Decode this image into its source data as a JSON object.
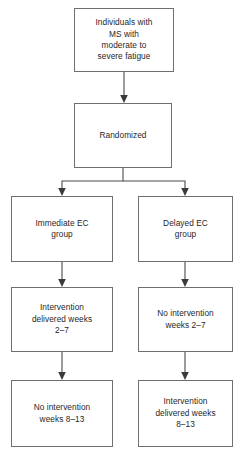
{
  "diagram": {
    "type": "flowchart",
    "orientation": "top-down",
    "colors": {
      "box_border": "#6f6f6f",
      "box_fill": "#ffffff",
      "arrow": "#4a4a4a",
      "text": "#1f1f1f",
      "background": "#ffffff"
    },
    "nodes": {
      "population": {
        "label": "Individuals with\nMS with\nmoderate to\nsevere fatigue",
        "row": 1
      },
      "randomized": {
        "label": "Randomized",
        "row": 2
      },
      "immediate_arm": {
        "label": "Immediate EC\ngroup",
        "row": 3,
        "column": "left"
      },
      "delayed_arm": {
        "label": "Delayed EC\ngroup",
        "row": 3,
        "column": "right"
      },
      "immediate_phase1": {
        "label": "Intervention\ndelivered weeks\n2–7",
        "row": 4,
        "column": "left"
      },
      "delayed_phase1": {
        "label": "No intervention\nweeks 2–7",
        "row": 4,
        "column": "right"
      },
      "immediate_phase2": {
        "label": "No intervention\nweeks 8–13",
        "row": 5,
        "column": "left"
      },
      "delayed_phase2": {
        "label": "Intervention\ndelivered weeks\n8–13",
        "row": 5,
        "column": "right"
      }
    },
    "edges": [
      {
        "from": "population",
        "to": "randomized",
        "style": "arrow"
      },
      {
        "from": "randomized",
        "to": "immediate_arm",
        "style": "split-arrow"
      },
      {
        "from": "randomized",
        "to": "delayed_arm",
        "style": "split-arrow"
      },
      {
        "from": "immediate_arm",
        "to": "immediate_phase1",
        "style": "arrow"
      },
      {
        "from": "delayed_arm",
        "to": "delayed_phase1",
        "style": "arrow"
      },
      {
        "from": "immediate_phase1",
        "to": "immediate_phase2",
        "style": "arrow"
      },
      {
        "from": "delayed_phase1",
        "to": "delayed_phase2",
        "style": "arrow"
      }
    ]
  }
}
